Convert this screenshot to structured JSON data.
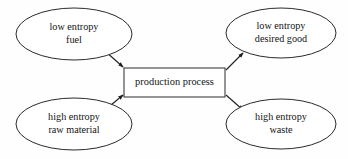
{
  "diagram": {
    "background_color": "#fefefe",
    "stroke_color": "#1f1f1f",
    "text_color": "#141414",
    "nodes": {
      "input_fuel": {
        "shape": "ellipse",
        "line1": "low entropy",
        "line2": "fuel",
        "cx": 74,
        "cy": 34,
        "rx": 58,
        "ry": 26
      },
      "input_raw_material": {
        "shape": "ellipse",
        "line1": "high entropy",
        "line2": "raw material",
        "cx": 74,
        "cy": 124,
        "rx": 58,
        "ry": 26
      },
      "process": {
        "shape": "rectangle",
        "label": "production process",
        "x": 124,
        "y": 68,
        "width": 101,
        "height": 29
      },
      "output_desired_good": {
        "shape": "ellipse",
        "line1": "low entropy",
        "line2": "desired good",
        "cx": 281,
        "cy": 33,
        "rx": 55,
        "ry": 25
      },
      "output_waste": {
        "shape": "ellipse",
        "line1": "high entropy",
        "line2": "waste",
        "cx": 281,
        "cy": 124,
        "rx": 55,
        "ry": 25
      }
    },
    "edges": [
      {
        "name": "fuel-to-process",
        "from": "input_fuel",
        "to": "process",
        "x1": 105,
        "y1": 51,
        "x2": 123,
        "y2": 67
      },
      {
        "name": "raw-material-to-process",
        "from": "input_raw_material",
        "to": "process",
        "x1": 105,
        "y1": 110,
        "x2": 123,
        "y2": 95
      },
      {
        "name": "process-to-desired-good",
        "from": "process",
        "to": "output_desired_good",
        "x1": 226,
        "y1": 70,
        "x2": 243,
        "y2": 53
      },
      {
        "name": "process-to-waste",
        "from": "process",
        "to": "output_waste",
        "x1": 226,
        "y1": 95,
        "x2": 243,
        "y2": 110
      }
    ]
  }
}
